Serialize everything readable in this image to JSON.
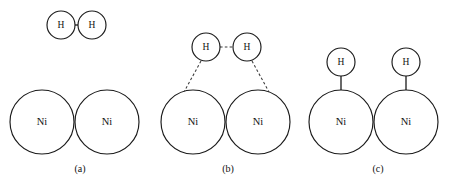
{
  "figure": {
    "background_color": "#ffffff",
    "stroke_color": "#1a1a1a",
    "dashed_stroke_color": "#3a3a3a",
    "atom_labels": {
      "hydrogen": "H",
      "nickel": "Ni"
    },
    "panels": [
      {
        "id": "a",
        "label": "(a)",
        "label_x": 80,
        "label_y": 172,
        "description": "Hydrogen molecule approaching the nickel surface",
        "substrate_atoms": [
          {
            "label": "Ni",
            "cx": 42,
            "cy": 122,
            "r": 32
          },
          {
            "label": "Ni",
            "cx": 107,
            "cy": 122,
            "r": 32
          }
        ],
        "hydrogen_atoms": [
          {
            "label": "H",
            "cx": 61,
            "cy": 25,
            "r": 14
          },
          {
            "label": "H",
            "cx": 92,
            "cy": 25,
            "r": 14
          }
        ],
        "bonds": [
          {
            "type": "solid",
            "x1": 75,
            "y1": 25,
            "x2": 78,
            "y2": 25
          }
        ]
      },
      {
        "id": "b",
        "label": "(b)",
        "label_x": 228,
        "label_y": 172,
        "description": "Transition state with weakened H-H bond and forming Ni-H bonds",
        "substrate_atoms": [
          {
            "label": "Ni",
            "cx": 193,
            "cy": 122,
            "r": 32
          },
          {
            "label": "Ni",
            "cx": 258,
            "cy": 122,
            "r": 32
          }
        ],
        "hydrogen_atoms": [
          {
            "label": "H",
            "cx": 206,
            "cy": 47,
            "r": 14
          },
          {
            "label": "H",
            "cx": 247,
            "cy": 47,
            "r": 14
          }
        ],
        "bonds": [
          {
            "type": "dashed",
            "x1": 220,
            "y1": 47,
            "x2": 233,
            "y2": 47
          },
          {
            "type": "dashed",
            "x1": 201,
            "y1": 61,
            "x2": 184,
            "y2": 92
          },
          {
            "type": "dashed",
            "x1": 252,
            "y1": 61,
            "x2": 269,
            "y2": 92
          }
        ]
      },
      {
        "id": "c",
        "label": "(c)",
        "label_x": 378,
        "label_y": 172,
        "description": "Dissociated hydrogen atoms chemisorbed on nickel atoms",
        "substrate_atoms": [
          {
            "label": "Ni",
            "cx": 341,
            "cy": 122,
            "r": 32
          },
          {
            "label": "Ni",
            "cx": 406,
            "cy": 122,
            "r": 32
          }
        ],
        "hydrogen_atoms": [
          {
            "label": "H",
            "cx": 341,
            "cy": 62,
            "r": 14
          },
          {
            "label": "H",
            "cx": 406,
            "cy": 62,
            "r": 14
          }
        ],
        "bonds": [
          {
            "type": "solid",
            "x1": 341,
            "y1": 76,
            "x2": 341,
            "y2": 90
          },
          {
            "type": "solid",
            "x1": 406,
            "y1": 76,
            "x2": 406,
            "y2": 90
          }
        ]
      }
    ]
  }
}
